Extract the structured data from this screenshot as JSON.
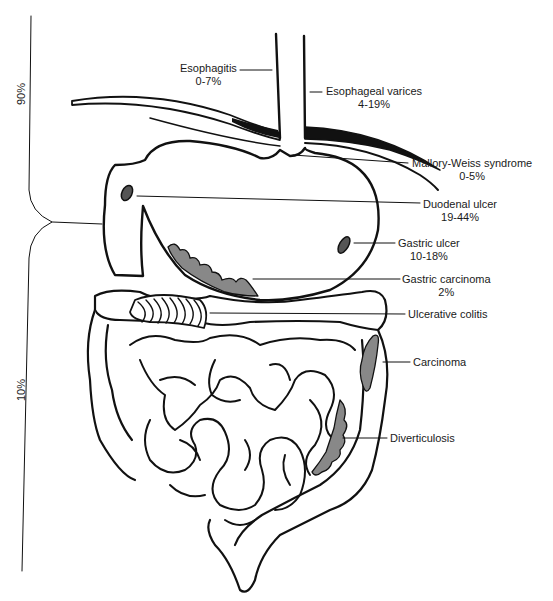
{
  "figure": {
    "bracket_upper": {
      "label": "90%"
    },
    "bracket_lower": {
      "label": "10%"
    },
    "labels": [
      {
        "id": "esophagitis",
        "name": "Esophagitis",
        "pct": "0-7%"
      },
      {
        "id": "esophageal-varices",
        "name": "Esophageal varices",
        "pct": "4-19%"
      },
      {
        "id": "mallory-weiss",
        "name": "Mallory-Weiss syndrome",
        "pct": "0-5%"
      },
      {
        "id": "duodenal-ulcer",
        "name": "Duodenal ulcer",
        "pct": "19-44%"
      },
      {
        "id": "gastric-ulcer",
        "name": "Gastric ulcer",
        "pct": "10-18%"
      },
      {
        "id": "gastric-carcinoma",
        "name": "Gastric carcinoma",
        "pct": "2%"
      },
      {
        "id": "ulcerative-colitis",
        "name": "Ulcerative colitis",
        "pct": ""
      },
      {
        "id": "carcinoma",
        "name": "Carcinoma",
        "pct": ""
      },
      {
        "id": "diverticulosis",
        "name": "Diverticulosis",
        "pct": ""
      }
    ]
  }
}
